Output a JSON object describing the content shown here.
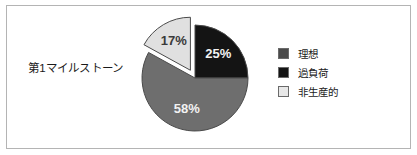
{
  "frame": {
    "border_color": "#b4b4b4",
    "background": "#ffffff"
  },
  "category_label": "第1マイルストーン",
  "legend": {
    "items": [
      {
        "label": "理想",
        "color": "#4a4a4a"
      },
      {
        "label": "過負荷",
        "color": "#141414"
      },
      {
        "label": "非生産的",
        "color": "#e8e8e8"
      }
    ]
  },
  "chart_data": {
    "type": "pie",
    "title": "第1マイルストーン",
    "categories": [
      "理想",
      "過負荷",
      "非生産的"
    ],
    "values": [
      58,
      25,
      17
    ],
    "data_labels": [
      "58%",
      "25%",
      "17%"
    ],
    "colors": [
      "#6e6e6e",
      "#141414",
      "#e0e0e0"
    ],
    "exploded": [
      "非生産的"
    ],
    "start_angle_deg": 0,
    "direction": "clockwise",
    "legend_position": "right",
    "grid": false,
    "xlabel": "",
    "ylabel": "",
    "slices": [
      {
        "name": "過負荷",
        "value": 25,
        "label": "25%",
        "color": "#141414",
        "exploded": false,
        "label_fill": "light"
      },
      {
        "name": "理想",
        "value": 58,
        "label": "58%",
        "color": "#6e6e6e",
        "exploded": false,
        "label_fill": "light"
      },
      {
        "name": "非生産的",
        "value": 17,
        "label": "17%",
        "color": "#e0e0e0",
        "exploded": true,
        "label_fill": "dark"
      }
    ]
  }
}
